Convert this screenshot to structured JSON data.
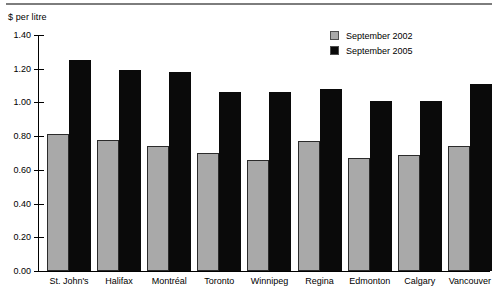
{
  "header": {
    "unit_label": "$ per litre"
  },
  "legend": [
    {
      "label": "September  2002",
      "color": "#a9a9a9",
      "series_key": "2002"
    },
    {
      "label": "September 2005",
      "color": "#0a0a0a",
      "series_key": "2005"
    }
  ],
  "axis": {
    "y_ticks": [
      "0.00",
      "0.20",
      "0.40",
      "0.60",
      "0.80",
      "1.00",
      "1.20",
      "1.40"
    ]
  },
  "chart_data": {
    "type": "bar",
    "title": "",
    "subtitle": "",
    "xlabel": "",
    "ylabel": "$ per litre",
    "ylim": [
      0.0,
      1.4
    ],
    "ytick_step": 0.2,
    "grid": false,
    "legend_position": "top-right",
    "categories": [
      "St. John's",
      "Halifax",
      "Montréal",
      "Toronto",
      "Winnipeg",
      "Regina",
      "Edmonton",
      "Calgary",
      "Vancouver"
    ],
    "series": [
      {
        "name": "September  2002",
        "color": "#a9a9a9",
        "values": [
          0.81,
          0.78,
          0.74,
          0.7,
          0.66,
          0.77,
          0.67,
          0.69,
          0.74
        ]
      },
      {
        "name": "September 2005",
        "color": "#0a0a0a",
        "values": [
          1.25,
          1.19,
          1.18,
          1.06,
          1.06,
          1.08,
          1.01,
          1.01,
          1.11
        ]
      }
    ]
  }
}
